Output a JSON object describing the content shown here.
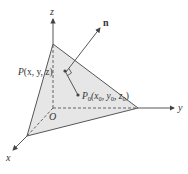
{
  "figure": {
    "type": "3d-plane-with-normal",
    "colors": {
      "plane_fill": "#e6e6e6",
      "lines": "#444444",
      "text": "#333333"
    },
    "axes": {
      "x_label": "x",
      "y_label": "y",
      "z_label": "z",
      "origin_label": "O"
    },
    "points": {
      "P": {
        "name": "P",
        "args": "(x, y, z)"
      },
      "P0": {
        "name": "P",
        "sub": "0",
        "args_parts": [
          "(x",
          "0",
          ", y",
          "0",
          ", z",
          "0",
          ")"
        ]
      }
    },
    "normal_label": "n"
  }
}
